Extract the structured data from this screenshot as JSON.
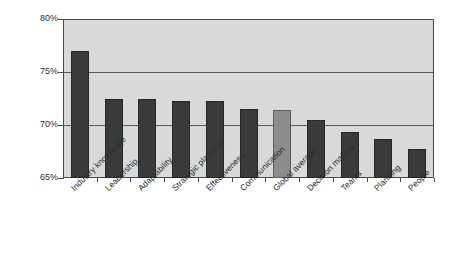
{
  "chart_data": {
    "type": "bar",
    "title": "",
    "subtitle": "",
    "xlabel": "",
    "ylabel": "",
    "ylim": [
      65,
      80
    ],
    "y_tick_labels": [
      "65%",
      "70%",
      "75%",
      "80%"
    ],
    "y_tick_values": [
      65,
      70,
      75,
      80
    ],
    "grid": true,
    "gridlines_at": [
      70,
      75
    ],
    "legend": "none",
    "value_suffix": "%",
    "categories": [
      "Industry knowledge",
      "Leadership",
      "Adaptability",
      "Strategic planning",
      "Effectiveness",
      "Communication",
      "Global average",
      "Decision making",
      "Teams",
      "Planning",
      "People"
    ],
    "values": [
      77.0,
      72.5,
      72.5,
      72.3,
      72.3,
      71.5,
      71.4,
      70.5,
      69.3,
      68.7,
      67.7
    ],
    "highlight_index": 6,
    "colors": {
      "bar": "#3a3a3a",
      "bar_border": "#262626",
      "highlight_bar": "#8c8c8c",
      "highlight_bar_border": "#5c5c5c",
      "plot_background": "#d9d9d9",
      "gridline": "#5a5a5a",
      "axis": "#4a4a4a",
      "text": "#2d2d2d",
      "page_background": "#fefefe"
    }
  }
}
